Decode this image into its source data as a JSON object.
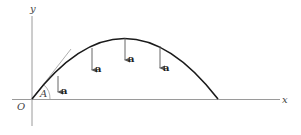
{
  "diagram": {
    "axes": {
      "x_label": "x",
      "y_label": "y",
      "origin_label": "O"
    },
    "angle_label": "A",
    "acceleration_label": "a",
    "acceleration_vectors": [
      {
        "label": "a",
        "x": 58,
        "y1": 76,
        "y2": 92
      },
      {
        "label": "a",
        "x": 92,
        "y1": 48,
        "y2": 70
      },
      {
        "label": "a",
        "x": 125,
        "y1": 38,
        "y2": 60
      },
      {
        "label": "a",
        "x": 160,
        "y1": 46,
        "y2": 68
      }
    ],
    "colors": {
      "axis": "#9a9a9a",
      "curve": "#1a1a1a",
      "arrow": "#555555",
      "text": "#333333"
    }
  }
}
